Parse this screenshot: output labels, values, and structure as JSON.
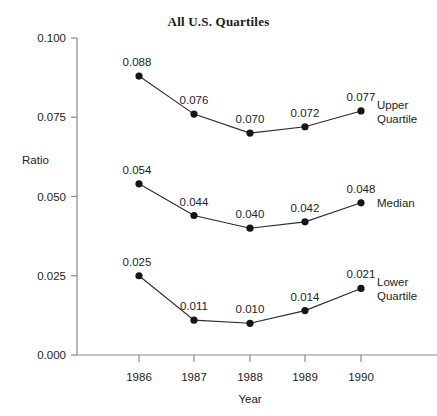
{
  "chart_data": {
    "type": "line",
    "title": "All U.S. Quartiles",
    "xlabel": "Year",
    "ylabel": "Ratio",
    "categories": [
      "1986",
      "1987",
      "1988",
      "1989",
      "1990"
    ],
    "x": [
      1986,
      1987,
      1988,
      1989,
      1990
    ],
    "ylim": [
      0.0,
      0.1
    ],
    "yticks": [
      "0.000",
      "0.025",
      "0.050",
      "0.075",
      "0.100"
    ],
    "ytick_values": [
      0.0,
      0.025,
      0.05,
      0.075,
      0.1
    ],
    "grid": false,
    "legend_position": "right-inline",
    "series": [
      {
        "name": "Upper Quartile",
        "label_lines": [
          "Upper",
          "Quartile"
        ],
        "values": [
          0.088,
          0.076,
          0.07,
          0.072,
          0.077
        ],
        "data_labels": [
          "0.088",
          "0.076",
          "0.070",
          "0.072",
          "0.077"
        ],
        "color": "#151515"
      },
      {
        "name": "Median",
        "label_lines": [
          "Median"
        ],
        "values": [
          0.054,
          0.044,
          0.04,
          0.042,
          0.048
        ],
        "data_labels": [
          "0.054",
          "0.044",
          "0.040",
          "0.042",
          "0.048"
        ],
        "color": "#151515"
      },
      {
        "name": "Lower Quartile",
        "label_lines": [
          "Lower",
          "Quartile"
        ],
        "values": [
          0.025,
          0.011,
          0.01,
          0.014,
          0.021
        ],
        "data_labels": [
          "0.025",
          "0.011",
          "0.010",
          "0.014",
          "0.021"
        ],
        "color": "#151515"
      }
    ]
  },
  "axis_color": "#8a8a8a",
  "text_color": "#232323"
}
